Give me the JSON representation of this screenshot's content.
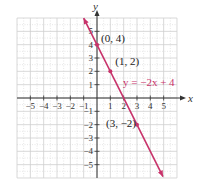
{
  "chart_data": {
    "type": "line",
    "title": "",
    "xlabel": "x",
    "ylabel": "y",
    "xlim": [
      -6,
      6
    ],
    "ylim": [
      -6,
      6
    ],
    "grid": true,
    "x_ticks": [
      -5,
      -4,
      -3,
      -2,
      -1,
      1,
      2,
      3,
      4,
      5
    ],
    "x_tick_labels": [
      "−5",
      "−4",
      "−3",
      "−2",
      "−1",
      "1",
      "2",
      "3",
      "4",
      "5"
    ],
    "y_ticks": [
      5,
      4,
      3,
      2,
      1,
      -1,
      -2,
      -3,
      -4,
      -5
    ],
    "y_tick_labels": [
      "5",
      "4",
      "3",
      "2",
      "1",
      "−1",
      "−2",
      "−3",
      "−4",
      "−5"
    ],
    "series": [
      {
        "name": "y = −2x + 4",
        "equation": "y = -2x + 4",
        "slope": -2,
        "intercept": 4,
        "color": "#c8336b",
        "x_range": [
          -1,
          5
        ],
        "points": [
          {
            "x": 0,
            "y": 4,
            "label": "(0, 4)"
          },
          {
            "x": 1,
            "y": 2,
            "label": "(1, 2)"
          },
          {
            "x": 3,
            "y": -2,
            "label": "(3, −2)"
          }
        ]
      }
    ],
    "annotations": [
      {
        "text": "y = −2x + 4",
        "x": 2.0,
        "y": 1.0,
        "color": "#c8336b"
      }
    ]
  },
  "colors": {
    "line": "#c8336b",
    "grid": "#cfcfcf",
    "axis": "#333333",
    "background": "#ffffff"
  }
}
